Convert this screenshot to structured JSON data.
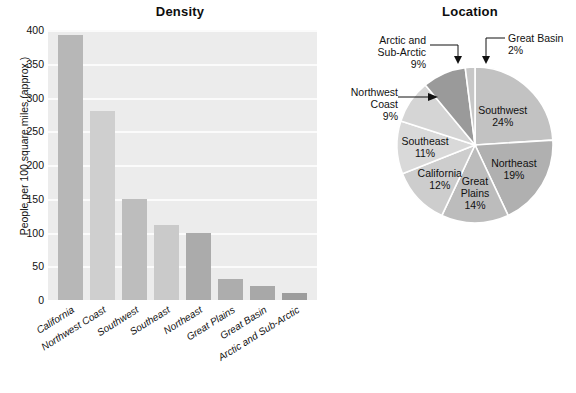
{
  "chart_data": [
    {
      "type": "bar",
      "title": "Density",
      "xlabel": "",
      "ylabel": "People per 100 square miles (approx.)",
      "ylim": [
        0,
        400
      ],
      "yticks": [
        0,
        50,
        100,
        150,
        200,
        250,
        300,
        350,
        400
      ],
      "grid": true,
      "legend": "none",
      "categories": [
        "California",
        "Northwest Coast",
        "Southwest",
        "Southeast",
        "Northeast",
        "Great Plains",
        "Great Basin",
        "Arctic and Sub-Arctic"
      ],
      "values": [
        393,
        280,
        150,
        111,
        100,
        31,
        21,
        11
      ],
      "bar_colors": [
        "#b7b7b7",
        "#cfcfcf",
        "#bdbdbd",
        "#cacaca",
        "#ababab",
        "#adadad",
        "#a8a8a8",
        "#9d9d9d"
      ],
      "plot_background": "#ececec",
      "gridline_color": "#fbfbfb"
    },
    {
      "type": "pie",
      "title": "Location",
      "labels": [
        "Southwest",
        "Northeast",
        "Great Plains",
        "California",
        "Southeast",
        "Northwest Coast",
        "Arctic and Sub-Arctic",
        "Great Basin"
      ],
      "values": [
        24,
        19,
        14,
        12,
        11,
        9,
        9,
        2
      ],
      "value_suffix": "%",
      "slice_colors": [
        "#c2c2c2",
        "#b0b0b0",
        "#bcbcbc",
        "#cdcdcd",
        "#d9d9d9",
        "#d5d5d5",
        "#9a9a9a",
        "#c7c7c7"
      ],
      "label_placement": [
        "inside",
        "inside",
        "inside",
        "inside",
        "inside",
        "callout",
        "callout",
        "callout"
      ]
    }
  ],
  "bar_chart": {
    "title": "Density",
    "y_axis_label": "People per 100 square miles (approx.)",
    "yticks": [
      "400",
      "350",
      "300",
      "250",
      "200",
      "150",
      "100",
      "50",
      "0"
    ],
    "bars": [
      {
        "label": "California",
        "value": 393,
        "color": "#b7b7b7"
      },
      {
        "label": "Northwest Coast",
        "value": 280,
        "color": "#cfcfcf"
      },
      {
        "label": "Southwest",
        "value": 150,
        "color": "#bdbdbd"
      },
      {
        "label": "Southeast",
        "value": 111,
        "color": "#cacaca"
      },
      {
        "label": "Northeast",
        "value": 100,
        "color": "#ababab"
      },
      {
        "label": "Great Plains",
        "value": 31,
        "color": "#adadad"
      },
      {
        "label": "Great Basin",
        "value": 21,
        "color": "#a8a8a8"
      },
      {
        "label": "Arctic and Sub-Arctic",
        "value": 11,
        "color": "#9d9d9d"
      }
    ]
  },
  "pie_chart": {
    "title": "Location",
    "inside_labels": [
      {
        "name": "Southwest",
        "pct": "24%"
      },
      {
        "name": "Northeast",
        "pct": "19%"
      },
      {
        "name": "Great",
        "pct": "14%",
        "name2": "Plains"
      },
      {
        "name": "California",
        "pct": "12%"
      },
      {
        "name": "Southeast",
        "pct": "11%"
      }
    ],
    "callouts": {
      "arctic": {
        "line1": "Arctic and",
        "line2": "Sub-Arctic",
        "line3": "9%"
      },
      "northwest": {
        "line1": "Northwest",
        "line2": "Coast",
        "line3": "9%"
      },
      "greatbasin": {
        "line1": "Great Basin",
        "line2": "2%"
      }
    }
  }
}
